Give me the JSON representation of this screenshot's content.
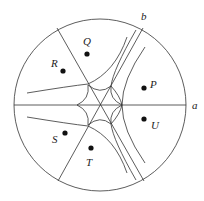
{
  "diagram": {
    "circle": {
      "cx": 100,
      "cy": 105,
      "r": 86
    },
    "axes": [
      {
        "name": "a",
        "label": "a",
        "label_x": 195,
        "label_y": 109
      },
      {
        "name": "b",
        "label": "b",
        "label_x": 141,
        "label_y": 20
      }
    ],
    "points": [
      {
        "label": "Q",
        "x": 87,
        "y": 54,
        "label_x": 83,
        "label_y": 45
      },
      {
        "label": "R",
        "x": 63,
        "y": 71,
        "label_x": 51,
        "label_y": 67
      },
      {
        "label": "P",
        "x": 144,
        "y": 88,
        "label_x": 150,
        "label_y": 88
      },
      {
        "label": "U",
        "x": 144,
        "y": 119,
        "label_x": 151,
        "label_y": 129
      },
      {
        "label": "S",
        "x": 65,
        "y": 133,
        "label_x": 52,
        "label_y": 143
      },
      {
        "label": "T",
        "x": 91,
        "y": 148,
        "label_x": 86,
        "label_y": 166
      }
    ]
  }
}
